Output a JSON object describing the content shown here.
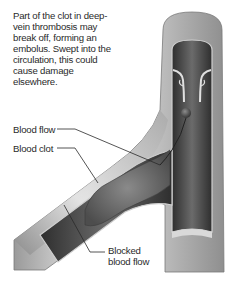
{
  "diagram": {
    "caption": "Part of the clot in deep-vein thrombosis may break off, forming an embolus. Swept into the circulation, this could cause damage elsewhere.",
    "caption_lines": [
      "Part of the clot in deep-",
      "vein thrombosis may",
      "break off, forming an",
      "embolus. Swept into the",
      "circulation, this could",
      "cause damage",
      "elsewhere."
    ],
    "labels": {
      "blood_flow": "Blood flow",
      "blood_clot": "Blood clot",
      "blocked_flow_line1": "Blocked",
      "blocked_flow_line2": "blood flow"
    },
    "elements": [
      "vein",
      "branch vein",
      "valves",
      "blood clot",
      "embolus"
    ],
    "colors": {
      "vein_wall": "#b8b8b8",
      "vein_wall_highlight": "#e6e6e6",
      "vein_interior": "#4a4a4a",
      "clot": "#6a6a6a",
      "leader_line": "#2a2a2a",
      "text": "#2a2a2a"
    }
  }
}
